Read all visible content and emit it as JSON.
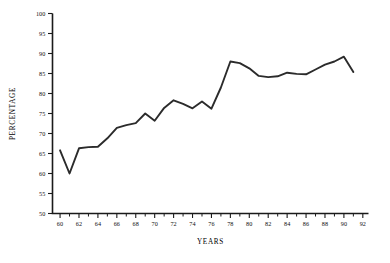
{
  "chart_data": {
    "type": "line",
    "title": "",
    "xlabel": "YEARS",
    "ylabel": "PERCENTAGE",
    "xlim": [
      59.2,
      92.6
    ],
    "ylim": [
      50,
      100
    ],
    "grid": false,
    "legend": null,
    "y_ticks": [
      50,
      55,
      60,
      65,
      70,
      75,
      80,
      85,
      90,
      95,
      100
    ],
    "y_tick_labels": [
      "50",
      "55",
      "60",
      "65",
      "70",
      "75",
      "80",
      "85",
      "90",
      "95",
      "100"
    ],
    "x_ticks": [
      60,
      62,
      64,
      66,
      68,
      70,
      72,
      74,
      76,
      78,
      80,
      82,
      84,
      86,
      88,
      90,
      92
    ],
    "x_tick_labels": [
      "60",
      "62",
      "64",
      "66",
      "68",
      "70",
      "72",
      "74",
      "76",
      "78",
      "80",
      "82",
      "84",
      "86",
      "88",
      "90",
      "92"
    ],
    "x_minor_ticks": [
      61,
      63,
      65,
      67,
      69,
      71,
      73,
      75,
      77,
      79,
      81,
      83,
      85,
      87,
      89,
      91
    ],
    "line_color": "#2b2b2b",
    "background_color": "#ffffff",
    "axis_color": "#1a1a1a",
    "x": [
      60,
      61,
      62,
      63,
      64,
      65,
      66,
      67,
      68,
      69,
      70,
      71,
      72,
      73,
      74,
      75,
      76,
      77,
      78,
      79,
      80,
      81,
      82,
      83,
      84,
      85,
      86,
      87,
      88,
      89,
      90,
      91
    ],
    "values": [
      65.8,
      60.0,
      66.3,
      66.6,
      66.7,
      68.8,
      71.4,
      72.1,
      72.6,
      75.0,
      73.2,
      76.4,
      78.3,
      77.4,
      76.3,
      78.0,
      76.2,
      81.5,
      88.0,
      87.6,
      86.3,
      84.4,
      84.1,
      84.3,
      85.2,
      84.9,
      84.8,
      86.0,
      87.2,
      88.0,
      89.2,
      85.4
    ]
  }
}
